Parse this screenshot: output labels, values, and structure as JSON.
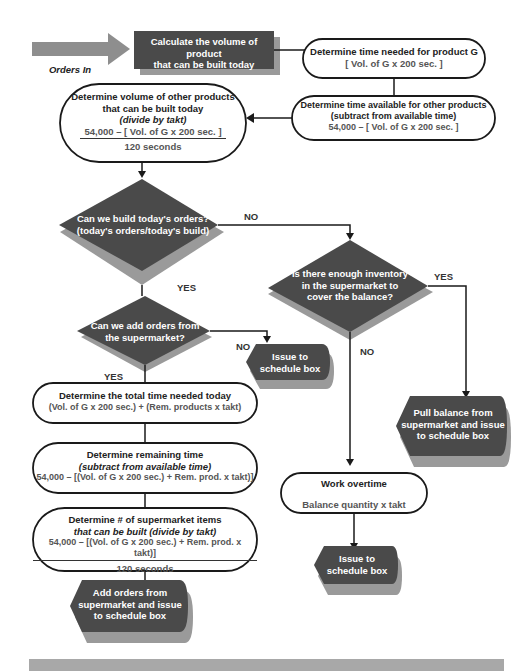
{
  "colors": {
    "dark_shape": "#4a4a4a",
    "shadow": "#9a9a9a",
    "arrow_in": "#8e8e8e",
    "line": "#1a1a1a",
    "footer_bar": "#a8a8a8"
  },
  "input": {
    "label": "Orders In",
    "icon": "right-arrow-icon"
  },
  "nodes": {
    "calculate": {
      "line1": "Calculate the volume of product",
      "line2": "that can be built today"
    },
    "time_g": {
      "line1": "Determine time needed for product G",
      "line2": "[ Vol. of G x 200 sec. ]"
    },
    "time_avail": {
      "line1": "Determine time available for other products",
      "line2": "(subtract from available time)",
      "line3": "54,000 – [ Vol. of G x 200 sec. ]"
    },
    "volume_other": {
      "line1": "Determine volume of other products",
      "line2": "that can be built today",
      "line3": "(divide by takt)",
      "numerator": "54,000 – [ Vol. of G x 200 sec. ]",
      "denominator": "120 seconds"
    },
    "decision_build": {
      "line1": "Can we build today's orders?",
      "line2": "(today's orders/today's build)"
    },
    "decision_inventory": {
      "line1": "Is there enough inventory",
      "line2": "in the supermarket to",
      "line3": "cover the balance?"
    },
    "decision_add": {
      "line1": "Can we add orders from",
      "line2": "the supermarket?"
    },
    "issue1": {
      "line1": "Issue to",
      "line2": "schedule box"
    },
    "total_time": {
      "line1": "Determine the total time needed today",
      "line2": "(Vol. of G x 200 sec.) + (Rem. products x takt)"
    },
    "remaining": {
      "line1": "Determine remaining time",
      "line2": "(subtract from available time)",
      "line3": "54,000 – [(Vol. of G x 200 sec.) + Rem. prod. x takt)]"
    },
    "supermarket_items": {
      "line1": "Determine # of supermarket items",
      "line2": "that can be built (divide by takt)",
      "numerator": "54,000 – [(Vol. of G x 200 sec.) + Rem. prod. x takt)]",
      "denominator": "120 seconds"
    },
    "add_orders": {
      "line1": "Add orders from",
      "line2": "supermarket and issue",
      "line3": "to schedule box"
    },
    "pull_balance": {
      "line1": "Pull balance from",
      "line2": "supermarket and issue",
      "line3": "to schedule box"
    },
    "overtime": {
      "line1": "Work overtime",
      "line2": "Balance quantity x takt"
    },
    "issue2": {
      "line1": "Issue to",
      "line2": "schedule box"
    }
  },
  "edges": {
    "build_no": "NO",
    "build_yes": "YES",
    "inventory_yes": "YES",
    "inventory_no": "NO",
    "add_no": "NO",
    "add_yes": "YES"
  }
}
